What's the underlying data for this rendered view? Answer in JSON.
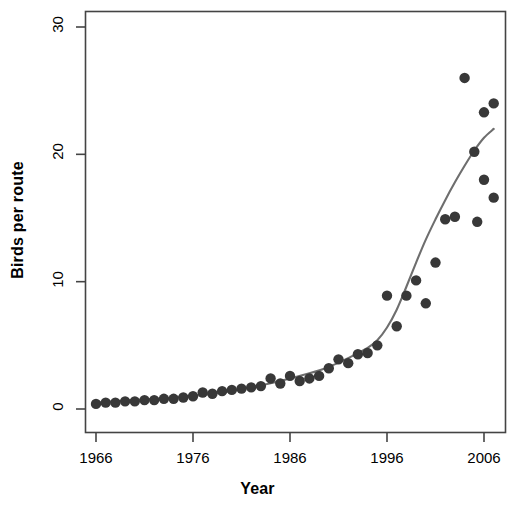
{
  "chart_data": {
    "type": "scatter",
    "title": "",
    "xlabel": "Year",
    "ylabel": "Birds per route",
    "xlim": [
      1965,
      2008
    ],
    "ylim": [
      -0.9,
      31.5
    ],
    "grid": false,
    "legend": "none",
    "x_ticks": [
      1966,
      1976,
      1986,
      1996,
      2006
    ],
    "x_tick_labels": [
      "1966",
      "1976",
      "1986",
      "1996",
      "2006"
    ],
    "y_ticks": [
      0,
      10,
      20,
      30
    ],
    "y_tick_labels": [
      "0",
      "10",
      "20",
      "30"
    ],
    "point_color": "#383838",
    "line_color": "#6e6e6e",
    "axis_color": "#444444",
    "series": [
      {
        "name": "Birds per route",
        "kind": "points",
        "x": [
          1966,
          1967,
          1968,
          1969,
          1970,
          1971,
          1972,
          1973,
          1974,
          1975,
          1976,
          1977,
          1978,
          1979,
          1980,
          1981,
          1982,
          1983,
          1984,
          1985,
          1986,
          1987,
          1988,
          1989,
          1990,
          1991,
          1992,
          1993,
          1994,
          1995,
          1996,
          1997,
          1998,
          1999,
          2000,
          2001,
          2002,
          2003,
          2004,
          2005,
          2006,
          2007
        ],
        "y": [
          0.4,
          0.5,
          0.5,
          0.6,
          0.6,
          0.7,
          0.7,
          0.8,
          0.8,
          0.9,
          1.0,
          1.3,
          1.2,
          1.4,
          1.5,
          1.6,
          1.7,
          1.8,
          2.4,
          2.0,
          2.6,
          2.2,
          2.4,
          2.6,
          3.2,
          3.9,
          3.6,
          4.3,
          4.4,
          5.0,
          8.9,
          6.5,
          8.9,
          10.1,
          8.3,
          11.5,
          14.9,
          15.1,
          26.0,
          20.2,
          18.0,
          16.6
        ]
      },
      {
        "name": "fitted trend",
        "kind": "line",
        "x": [
          1966,
          1970,
          1974,
          1978,
          1982,
          1985,
          1988,
          1990,
          1992,
          1994,
          1995,
          1996,
          1997,
          1998,
          1999,
          2000,
          2001,
          2002,
          2003,
          2004,
          2005,
          2006,
          2007
        ],
        "y": [
          0.5,
          0.7,
          0.9,
          1.2,
          1.7,
          2.2,
          2.8,
          3.3,
          4.0,
          4.8,
          5.4,
          6.4,
          7.8,
          9.6,
          11.5,
          13.3,
          14.9,
          16.4,
          17.8,
          19.1,
          20.3,
          21.3,
          22.0
        ]
      },
      {
        "name": "late-period observations",
        "kind": "points-extra",
        "x": [
          2005.3,
          2006.0,
          2007.0
        ],
        "y": [
          14.7,
          23.3,
          24.0
        ]
      }
    ]
  },
  "axis": {
    "x_title": "Year",
    "y_title": "Birds per route"
  }
}
